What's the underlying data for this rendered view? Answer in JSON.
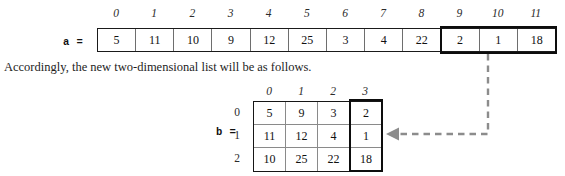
{
  "figure": {
    "caption": "Accordingly, the new two-dimensional list will be as follows.",
    "array_a": {
      "label": "a =",
      "indices": [
        "0",
        "1",
        "2",
        "3",
        "4",
        "5",
        "6",
        "7",
        "8",
        "9",
        "10",
        "11"
      ],
      "values": [
        "5",
        "11",
        "10",
        "9",
        "12",
        "25",
        "3",
        "4",
        "22",
        "2",
        "1",
        "18"
      ],
      "highlight_start_index": 9,
      "highlight_end_index": 11
    },
    "matrix_b": {
      "label": "b =",
      "column_headers": [
        "0",
        "1",
        "2",
        "3"
      ],
      "row_headers": [
        "0",
        "1",
        "2"
      ],
      "rows": [
        [
          "5",
          "9",
          "3",
          "2"
        ],
        [
          "11",
          "12",
          "4",
          "1"
        ],
        [
          "10",
          "25",
          "22",
          "18"
        ]
      ],
      "highlight_column_index": 3
    },
    "connector": {
      "style": "dashed",
      "color": "#8c8c8c",
      "direction": "down-then-left",
      "arrowhead": "left"
    }
  },
  "colors": {
    "page_background": "#ffffff",
    "text": "#1a1a1a",
    "cell_border": "#6e6e6e",
    "outer_border": "#1a1a1a",
    "highlight_border": "#0d0d0d",
    "connector": "#8c8c8c"
  }
}
